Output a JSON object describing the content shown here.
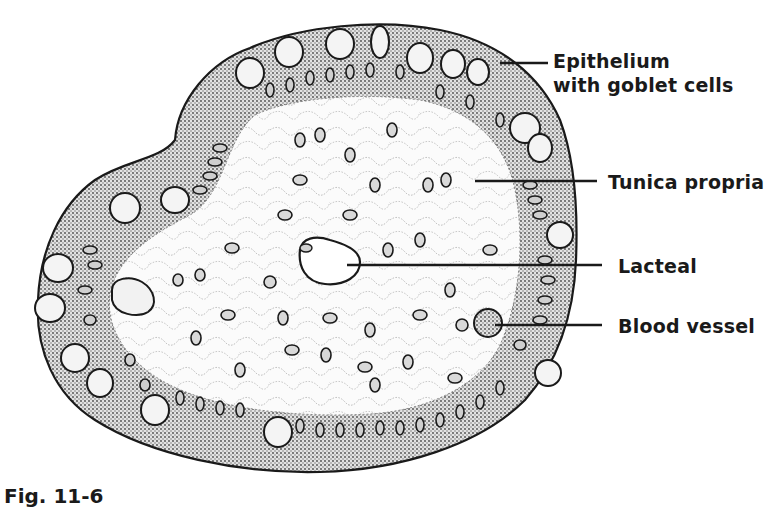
{
  "figure": {
    "caption": "Fig. 11-6"
  },
  "labels": [
    {
      "id": "epithelium",
      "line1": "Epithelium",
      "line2": "with goblet  cells",
      "x": 553,
      "y": 49,
      "leader": [
        [
          500,
          63
        ],
        [
          548,
          63
        ]
      ]
    },
    {
      "id": "tunica-propria",
      "line1": "Tunica propria",
      "x": 608,
      "y": 170,
      "leader": [
        [
          475,
          181
        ],
        [
          597,
          181
        ]
      ]
    },
    {
      "id": "lacteal",
      "line1": "Lacteal",
      "x": 618,
      "y": 254,
      "leader": [
        [
          347,
          265
        ],
        [
          602,
          265
        ]
      ]
    },
    {
      "id": "blood-vessel",
      "line1": "Blood vessel",
      "x": 618,
      "y": 314,
      "leader": [
        [
          495,
          325
        ],
        [
          602,
          325
        ]
      ]
    }
  ],
  "colors": {
    "ink": "#1a1a1a",
    "epithelium_fill": "#bdbdbd",
    "lamina_fill": "#f7f7f7",
    "background": "#ffffff"
  }
}
